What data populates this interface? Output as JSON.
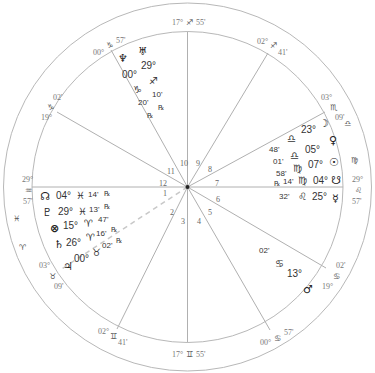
{
  "chart": {
    "title": "",
    "house_cusps": [
      {
        "house": 10,
        "deg": "17°",
        "sign": "♐",
        "min": "55'"
      },
      {
        "house": 11,
        "deg": "19°",
        "sign": "♑",
        "min": "02'"
      },
      {
        "house": 12,
        "deg": "00°",
        "sign": "♑",
        "min": "57'"
      },
      {
        "house": 1,
        "deg": "29°",
        "sign": "♒",
        "min": "57'"
      },
      {
        "house": 2,
        "deg": "03°",
        "sign": "♉",
        "min": "09'"
      },
      {
        "house": 3,
        "deg": "02°",
        "sign": "♊",
        "min": "41'"
      },
      {
        "house": 4,
        "deg": "17°",
        "sign": "♊",
        "min": "55'"
      },
      {
        "house": 5,
        "deg": "00°",
        "sign": "♋",
        "min": "57'"
      },
      {
        "house": 6,
        "deg": "19°",
        "sign": "♋",
        "min": "02'"
      },
      {
        "house": 7,
        "deg": "29°",
        "sign": "♌",
        "min": "57'"
      },
      {
        "house": 8,
        "deg": "03°",
        "sign": "♏",
        "min": "09'"
      },
      {
        "house": 9,
        "deg": "02°",
        "sign": "♐",
        "min": "41'"
      }
    ],
    "intercepted_signs": [
      {
        "sign": "♒",
        "near_house": 1
      },
      {
        "sign": "♓",
        "near_house": 1
      },
      {
        "sign": "♈",
        "near_house": 1
      },
      {
        "sign": "♎",
        "near_house": 7
      },
      {
        "sign": "♍",
        "near_house": 7
      }
    ],
    "house_numbers": [
      "1",
      "2",
      "3",
      "4",
      "5",
      "6",
      "7",
      "8",
      "9",
      "10",
      "11",
      "12"
    ],
    "planets": [
      {
        "name": "Uranus",
        "glyph": "♅",
        "deg": "29°",
        "sign": "♐",
        "min": "10'",
        "retro": "℞"
      },
      {
        "name": "Neptune",
        "glyph": "♆",
        "deg": "00°",
        "sign": "♑",
        "min": "20'",
        "retro": "℞"
      },
      {
        "name": "Moon",
        "glyph": "☽",
        "deg": "23°",
        "sign": "♎",
        "min": "48'",
        "retro": ""
      },
      {
        "name": "Venus",
        "glyph": "♀",
        "deg": "05°",
        "sign": "♎",
        "min": "01'",
        "retro": ""
      },
      {
        "name": "Sun",
        "glyph": "☉",
        "deg": "07°",
        "sign": "♍",
        "min": "58'",
        "retro": ""
      },
      {
        "name": "South Node",
        "glyph": "☋",
        "deg": "04°",
        "sign": "♍",
        "min": "14'",
        "retro": "℞"
      },
      {
        "name": "Mercury",
        "glyph": "☿",
        "deg": "25°",
        "sign": "♌",
        "min": "32'",
        "retro": ""
      },
      {
        "name": "Mars",
        "glyph": "♂",
        "deg": "13°",
        "sign": "♋",
        "min": "02'",
        "retro": ""
      },
      {
        "name": "North Node",
        "glyph": "☊",
        "deg": "04°",
        "sign": "♓",
        "min": "14'",
        "retro": "℞"
      },
      {
        "name": "Pluto",
        "glyph": "♇",
        "deg": "29°",
        "sign": "♓",
        "min": "13'",
        "retro": "℞"
      },
      {
        "name": "Part of Fortune",
        "glyph": "⊗",
        "deg": "15°",
        "sign": "♈",
        "min": "47'",
        "retro": ""
      },
      {
        "name": "Saturn",
        "glyph": "♄",
        "deg": "26°",
        "sign": "♈",
        "min": "16'",
        "retro": "℞"
      },
      {
        "name": "Jupiter",
        "glyph": "♃",
        "deg": "00°",
        "sign": "♉",
        "min": "02'",
        "retro": "℞"
      }
    ]
  }
}
